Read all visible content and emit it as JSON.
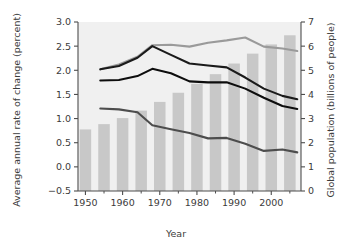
{
  "chart_data": {
    "type": "bar",
    "title": "",
    "subtitle": "",
    "xlabel": "Year",
    "ylabel": "Average annual rate of change (percent)",
    "ylabel_right": "Global population (billions of people)",
    "xlim": [
      1948,
      2008
    ],
    "ylim": [
      -0.5,
      3.0
    ],
    "ylim_right": [
      0,
      7
    ],
    "grid": false,
    "legend": "none",
    "x_ticks": [
      1950,
      1960,
      1970,
      1980,
      1990,
      2000
    ],
    "x_tick_labels": [
      "1950",
      "1960",
      "1970",
      "1980",
      "1990",
      "2000"
    ],
    "x_minor_ticks": [
      1955,
      1965,
      1975,
      1985,
      1995,
      2005
    ],
    "y_ticks": [
      -0.5,
      0.0,
      0.5,
      1.0,
      1.5,
      2.0,
      2.5,
      3.0
    ],
    "y_tick_labels": [
      "−0.5",
      "0.0",
      "0.5",
      "1.0",
      "1.5",
      "2.0",
      "2.5",
      "3.0"
    ],
    "y_ticks_right": [
      0,
      1,
      2,
      3,
      4,
      5,
      6,
      7
    ],
    "y_tick_labels_right": [
      "0",
      "1",
      "2",
      "3",
      "4",
      "5",
      "6",
      "7"
    ],
    "bars": {
      "name": "Global population",
      "axis": "right",
      "color": "#c8c8c8",
      "categories": [
        1950,
        1955,
        1960,
        1965,
        1970,
        1975,
        1980,
        1985,
        1990,
        1995,
        2000,
        2005
      ],
      "values": [
        2.55,
        2.77,
        3.02,
        3.33,
        3.69,
        4.07,
        4.44,
        4.84,
        5.28,
        5.69,
        6.07,
        6.45
      ]
    },
    "series": [
      {
        "name": "Upper rate line",
        "axis": "left",
        "color": "#9a9a9a",
        "x": [
          1954,
          1959,
          1964,
          1968,
          1973,
          1978,
          1983,
          1988,
          1993,
          1998,
          2003,
          2007
        ],
        "values": [
          2.02,
          2.12,
          2.28,
          2.52,
          2.53,
          2.49,
          2.57,
          2.62,
          2.68,
          2.49,
          2.45,
          2.4
        ]
      },
      {
        "name": "Middle rate line",
        "axis": "left",
        "color": "#1a1a1a",
        "x": [
          1954,
          1959,
          1964,
          1968,
          1973,
          1978,
          1983,
          1988,
          1993,
          1998,
          2003,
          2007
        ],
        "values": [
          2.02,
          2.09,
          2.26,
          2.5,
          2.32,
          2.14,
          2.1,
          2.06,
          1.85,
          1.62,
          1.47,
          1.4
        ]
      },
      {
        "name": "Lower-middle rate line",
        "axis": "left",
        "color": "#0d0d0d",
        "x": [
          1954,
          1959,
          1964,
          1968,
          1973,
          1978,
          1983,
          1988,
          1993,
          1998,
          2003,
          2007
        ],
        "values": [
          1.79,
          1.8,
          1.88,
          2.03,
          1.94,
          1.77,
          1.75,
          1.75,
          1.62,
          1.43,
          1.26,
          1.2
        ]
      },
      {
        "name": "Bottom rate line",
        "axis": "left",
        "color": "#4d4d4d",
        "x": [
          1954,
          1959,
          1964,
          1968,
          1973,
          1978,
          1983,
          1988,
          1993,
          1998,
          2003,
          2007
        ],
        "values": [
          1.21,
          1.19,
          1.13,
          0.86,
          0.78,
          0.7,
          0.59,
          0.6,
          0.48,
          0.33,
          0.36,
          0.3
        ]
      }
    ]
  },
  "colors": {
    "plot_background": "#f0f0f0",
    "axis": "#4d4d4d",
    "text": "#3b3b3b",
    "bar": "#c8c8c8",
    "line_gray": "#9a9a9a",
    "line_black": "#1a1a1a",
    "line_dark": "#0d0d0d",
    "line_mid": "#4d4d4d"
  }
}
